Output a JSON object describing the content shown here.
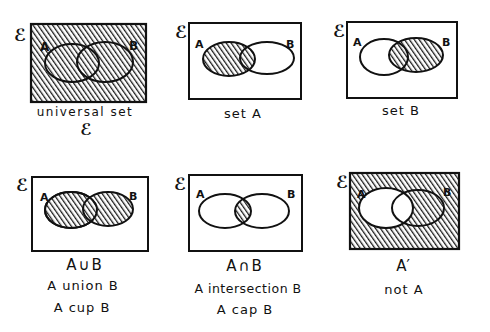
{
  "universal_symbol": "ℰ",
  "colors": {
    "ink": "#111111",
    "hatch": "#1a1a1a",
    "paper": "#ffffff"
  },
  "panels": [
    {
      "id": "universal",
      "set_a": "A",
      "set_b": "B",
      "shaded": "universal",
      "captions": [
        "universal set",
        "ℰ"
      ]
    },
    {
      "id": "set-a",
      "set_a": "A",
      "set_b": "B",
      "shaded": "A",
      "captions": [
        "set A"
      ]
    },
    {
      "id": "set-b",
      "set_a": "A",
      "set_b": "B",
      "shaded": "B",
      "captions": [
        "set B"
      ]
    },
    {
      "id": "union",
      "set_a": "A",
      "set_b": "B",
      "shaded": "A∪B",
      "captions": [
        "A∪B",
        "A union B",
        "A cup B"
      ]
    },
    {
      "id": "intersection",
      "set_a": "A",
      "set_b": "B",
      "shaded": "A∩B",
      "captions": [
        "A∩B",
        "A intersection B",
        "A cap B"
      ]
    },
    {
      "id": "complement",
      "set_a": "A",
      "set_b": "B",
      "shaded": "A'",
      "captions": [
        "A′",
        "not A"
      ]
    }
  ]
}
